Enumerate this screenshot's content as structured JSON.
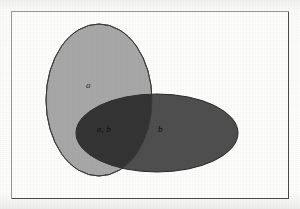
{
  "figure": {
    "type": "venn-diagram",
    "title": "",
    "background_color": "#fdfdfc",
    "frame": {
      "name": "diagram-frame",
      "stroke_color": "#4a4a4a",
      "x": 11,
      "y": 11,
      "width": 278,
      "height": 188
    },
    "sets": [
      {
        "id": "a",
        "label": "a",
        "shape": "ellipse",
        "fill_color": "#a8a8a8",
        "stroke_color": "#3c3c3c",
        "cx": 99,
        "cy": 100,
        "rx": 53,
        "ry": 76,
        "rotation_deg": 0
      },
      {
        "id": "b",
        "label": "b",
        "shape": "ellipse",
        "fill_color": "#4f4f4f",
        "stroke_color": "#2a2a2a",
        "cx": 157,
        "cy": 133,
        "rx": 81,
        "ry": 39,
        "rotation_deg": 0
      }
    ],
    "intersection": {
      "id": "a-and-b",
      "label": "a, b",
      "fill_color": "#373737"
    }
  },
  "labels": {
    "set_a": "a",
    "set_b": "b",
    "intersection": "a, b"
  }
}
